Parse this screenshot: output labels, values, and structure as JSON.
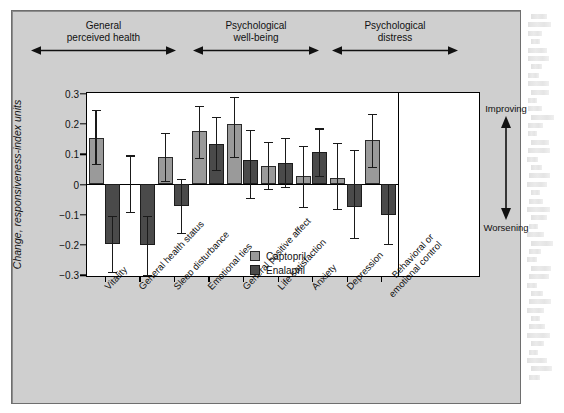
{
  "figure": {
    "background_color": "#ffffff",
    "panel_color": "#cfcfcf",
    "plot_background": "#ffffff"
  },
  "colors": {
    "captopril": "#9a9a9a",
    "enalapril": "#4a4a4a",
    "axis": "#000000",
    "text": "#111111"
  },
  "legend": {
    "position": "inside-center-bottom",
    "items": [
      {
        "label": "Captopril",
        "color": "#9a9a9a"
      },
      {
        "label": "Enalapril",
        "color": "#4a4a4a"
      }
    ]
  },
  "direction_key": {
    "top_label": "Improving",
    "bottom_label": "Worsening",
    "icon": "double-headed-vertical-arrow"
  },
  "groups": [
    {
      "label_line1": "General",
      "label_line2": "perceived health"
    },
    {
      "label_line1": "Psychological",
      "label_line2": "well-being"
    },
    {
      "label_line1": "Psychological",
      "label_line2": "distress"
    }
  ],
  "chart_data": {
    "type": "bar",
    "title": "",
    "subtitle": "",
    "xlabel": "",
    "ylabel": "Change, responsiveness-index units",
    "ylim": [
      -0.3,
      0.3
    ],
    "yticks": [
      0.3,
      0.2,
      0.1,
      0,
      -0.1,
      -0.2,
      -0.3
    ],
    "ytick_labels": [
      "0.3",
      "0.2",
      "0.1",
      "0",
      "−0.1",
      "−0.2",
      "−0.3"
    ],
    "grid": false,
    "legend_position": "center-bottom-inside",
    "error_bars": "95% confidence interval",
    "categories": [
      "Vitality",
      "General health status",
      "Sleep disturbance",
      "Emotional ties",
      "General positive affect",
      "Life satisfaction",
      "Anxiety",
      "Depression",
      "Behavioral or emotional control"
    ],
    "category_lines": [
      [
        "Vitality"
      ],
      [
        "General health status"
      ],
      [
        "Sleep disturbance"
      ],
      [
        "Emotional ties"
      ],
      [
        "General positive affect"
      ],
      [
        "Life satisfaction"
      ],
      [
        "Anxiety"
      ],
      [
        "Depression"
      ],
      [
        "Behavioral or",
        "emotional control"
      ]
    ],
    "category_groups": [
      0,
      0,
      0,
      1,
      1,
      1,
      2,
      2,
      2
    ],
    "series": [
      {
        "name": "Captopril",
        "color": "#9a9a9a",
        "values": [
          0.15,
          null,
          0.09,
          0.173,
          0.198,
          0.059,
          0.025,
          0.018,
          0.145
        ],
        "err_low": [
          0.067,
          null,
          0.011,
          0.085,
          0.089,
          -0.018,
          -0.076,
          -0.083,
          0.055
        ],
        "err_high": [
          0.245,
          null,
          0.168,
          0.258,
          0.287,
          0.138,
          0.125,
          0.135,
          0.232
        ]
      },
      {
        "name": "Enalapril",
        "color": "#4a4a4a",
        "values": [
          -0.2,
          -0.203,
          -0.072,
          0.133,
          0.08,
          0.07,
          0.104,
          -0.076,
          -0.103
        ],
        "err_low": [
          -0.29,
          -0.3,
          -0.163,
          0.047,
          -0.045,
          -0.01,
          0.025,
          -0.178,
          -0.199
        ],
        "err_high": [
          -0.105,
          -0.105,
          0.015,
          0.22,
          0.178,
          0.152,
          0.183,
          0.112,
          0.0
        ]
      }
    ]
  },
  "special_markers": {
    "general_health_status_captopril_errorbar": {
      "low": -0.092,
      "high": 0.094,
      "value_bar_drawn": false
    }
  }
}
